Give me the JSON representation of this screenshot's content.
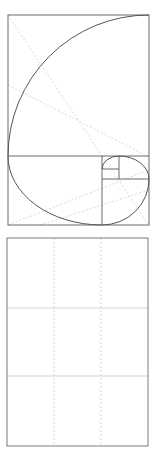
{
  "diagrams": {
    "golden_spiral": {
      "label": "Golden ratio spiral composition guide",
      "frame": {
        "x": 8,
        "y": 15,
        "width": 141,
        "height": 210
      },
      "line_color": "#6b6b6b",
      "guide_color": "#c8c8c8"
    },
    "rule_of_thirds": {
      "label": "Rule of thirds grid composition guide",
      "frame": {
        "x": 7,
        "y": 238,
        "width": 141,
        "height": 208
      },
      "line_color": "#7a7a7a",
      "grid_color": "#c8c8c8",
      "columns": 3,
      "rows": 3
    }
  }
}
